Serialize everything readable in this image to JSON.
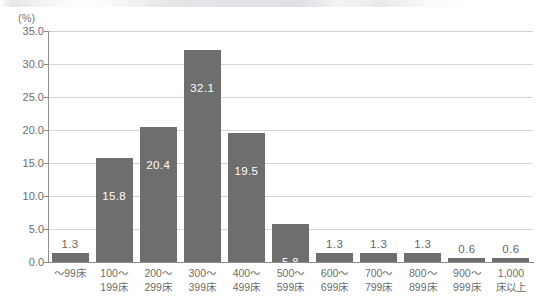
{
  "chart_data": {
    "type": "bar",
    "title": "",
    "xlabel": "",
    "ylabel": "(%)",
    "unit_label": "(%)",
    "ylim": [
      0.0,
      35.0
    ],
    "ytick_step": 5.0,
    "grid": true,
    "legend": "none",
    "bar_color": "#6e6e6e",
    "gridline_color": "#d5d5d5",
    "axis_color": "#8e8e8e",
    "yticks": [
      "0.0",
      "5.0",
      "10.0",
      "15.0",
      "20.0",
      "25.0",
      "30.0",
      "35.0"
    ],
    "ytick_values": [
      0.0,
      5.0,
      10.0,
      15.0,
      20.0,
      25.0,
      30.0,
      35.0
    ],
    "categories": [
      "～99床",
      "100～199床",
      "200～299床",
      "300～399床",
      "400～499床",
      "500～599床",
      "600～699床",
      "700～799床",
      "800～899床",
      "900～999床",
      "1,000床以上"
    ],
    "category_lines": [
      [
        "～99床",
        ""
      ],
      [
        "100～",
        "199床"
      ],
      [
        "200～",
        "299床"
      ],
      [
        "300～",
        "399床"
      ],
      [
        "400～",
        "499床"
      ],
      [
        "500～",
        "599床"
      ],
      [
        "600～",
        "699床"
      ],
      [
        "700～",
        "799床"
      ],
      [
        "800～",
        "899床"
      ],
      [
        "900～",
        "999床"
      ],
      [
        "1,000",
        "床以上"
      ]
    ],
    "values": [
      1.3,
      15.8,
      20.4,
      32.1,
      19.5,
      5.8,
      1.3,
      1.3,
      1.3,
      0.6,
      0.6
    ],
    "value_labels": [
      "1.3",
      "15.8",
      "20.4",
      "32.1",
      "19.5",
      "5.8",
      "1.3",
      "1.3",
      "1.3",
      "0.6",
      "0.6"
    ],
    "label_placement": [
      "outside",
      "inside",
      "inside",
      "inside",
      "inside",
      "inside",
      "outside",
      "outside",
      "outside",
      "outside",
      "outside"
    ]
  }
}
